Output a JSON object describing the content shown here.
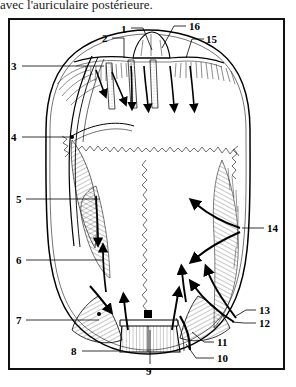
{
  "caption": {
    "text": "avec l'auriculaire postérieure."
  },
  "figure": {
    "title_absent": true,
    "kind": "anatomical-line-drawing",
    "frame": {
      "stroke": "#111111",
      "fill": "#ffffff"
    },
    "ink_color": "#000000"
  },
  "labels": [
    {
      "id": "1",
      "text": "1",
      "x": 121,
      "y": 24,
      "side": "top"
    },
    {
      "id": "2",
      "text": "2",
      "x": 102,
      "y": 35,
      "side": "top-left"
    },
    {
      "id": "3",
      "text": "3",
      "x": 10,
      "y": 63,
      "side": "left"
    },
    {
      "id": "4",
      "text": "4",
      "x": 10,
      "y": 134,
      "side": "left"
    },
    {
      "id": "5",
      "text": "5",
      "x": 15,
      "y": 196,
      "side": "left"
    },
    {
      "id": "6",
      "text": "6",
      "x": 15,
      "y": 257,
      "side": "left"
    },
    {
      "id": "7",
      "text": "7",
      "x": 15,
      "y": 317,
      "side": "left"
    },
    {
      "id": "8",
      "text": "8",
      "x": 71,
      "y": 348,
      "side": "bottom-left"
    },
    {
      "id": "9",
      "text": "9",
      "x": 146,
      "y": 369,
      "side": "bottom"
    },
    {
      "id": "10",
      "text": "10",
      "x": 216,
      "y": 362,
      "side": "bottom-right"
    },
    {
      "id": "11",
      "text": "11",
      "x": 216,
      "y": 346,
      "side": "bottom-right"
    },
    {
      "id": "12",
      "text": "12",
      "x": 258,
      "y": 320,
      "side": "right"
    },
    {
      "id": "13",
      "text": "13",
      "x": 258,
      "y": 307,
      "side": "right"
    },
    {
      "id": "14",
      "text": "14",
      "x": 266,
      "y": 224,
      "side": "right"
    },
    {
      "id": "15",
      "text": "15",
      "x": 206,
      "y": 35,
      "side": "top-right"
    },
    {
      "id": "16",
      "text": "16",
      "x": 188,
      "y": 22,
      "side": "top-right"
    }
  ]
}
